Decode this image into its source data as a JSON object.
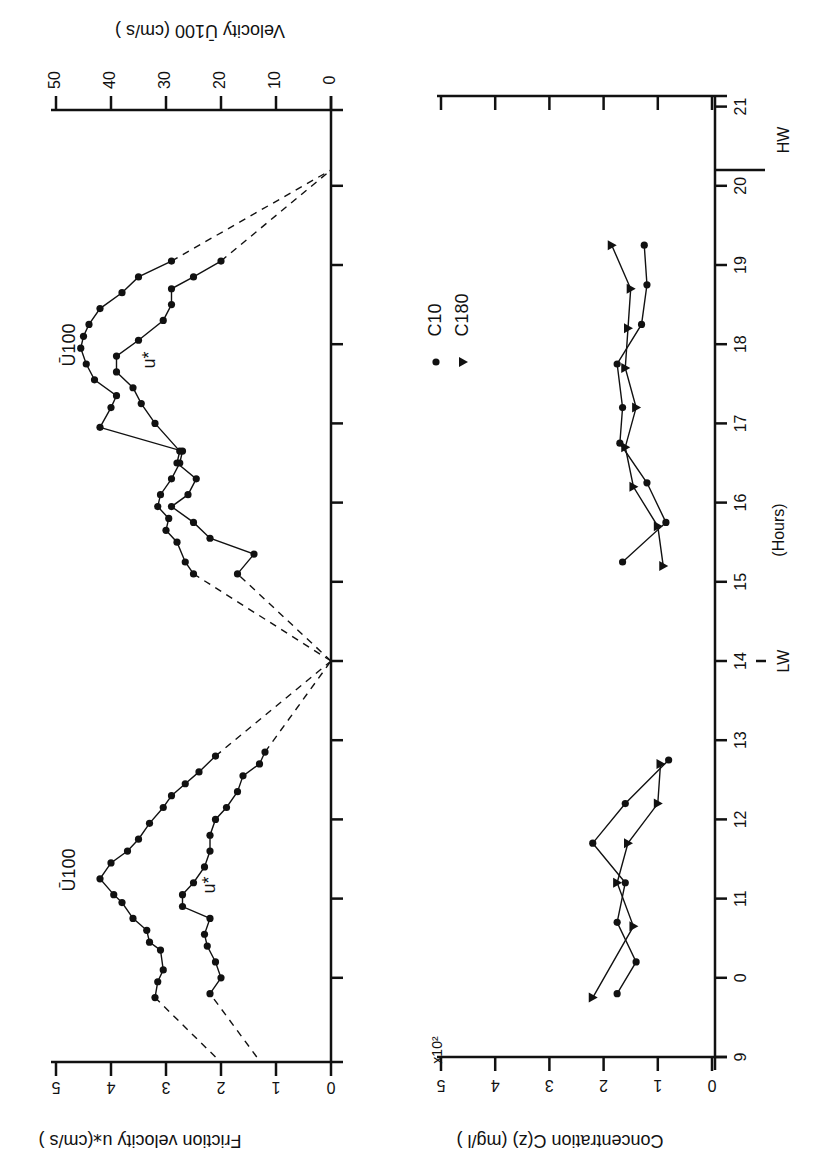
{
  "figure": {
    "orientation": "rotated 90deg clockwise",
    "x_axis": {
      "label": "(Hours)",
      "ticks": [
        9,
        10,
        11,
        12,
        13,
        14,
        15,
        16,
        17,
        18,
        19,
        20,
        21
      ],
      "tick_labels": [
        "9",
        "0",
        "11",
        "12",
        "13",
        "14",
        "15",
        "16",
        "17",
        "18",
        "19",
        "20",
        "21"
      ],
      "markers": [
        {
          "label": "LW",
          "hour": 14
        },
        {
          "label": "HW",
          "hour": 20.2
        }
      ]
    },
    "upper_panel": {
      "left_axis_label": "Friction velocity u⁎(cm/s )",
      "left_axis_ticks": [
        "0",
        "1",
        "2",
        "3",
        "4",
        "5"
      ],
      "right_axis_label": "Velocity Ū100 (cm/s )",
      "right_axis_ticks": [
        "0",
        "10",
        "20",
        "30",
        "40",
        "50"
      ],
      "series_labels": {
        "u100": "Ū100",
        "ustar": "u*"
      }
    },
    "lower_panel": {
      "axis_label": "Concentration C(z) (mg/l )",
      "axis_ticks": [
        "0",
        "1",
        "2",
        "3",
        "4",
        "5"
      ],
      "multiplier": "x10²",
      "legend": [
        {
          "marker": "circle",
          "label": "C10"
        },
        {
          "marker": "triangle",
          "label": "C180"
        }
      ]
    }
  },
  "chart_data": [
    {
      "type": "line",
      "title": "",
      "xlabel": "Hours",
      "ylabel": "Velocity Ū100 (cm/s) / Friction velocity u* (cm/s)",
      "xlim": [
        9,
        21
      ],
      "ylim_left": [
        0,
        5
      ],
      "ylim_right": [
        0,
        50
      ],
      "grid": false,
      "series": [
        {
          "name": "Ū100 (cm/s)",
          "x": [
            9.75,
            9.95,
            10.1,
            10.35,
            10.45,
            10.6,
            10.75,
            10.95,
            11.05,
            11.25,
            11.45,
            11.6,
            11.75,
            11.95,
            12.15,
            12.3,
            12.45,
            12.6,
            12.8,
            15.1,
            15.25,
            15.5,
            15.65,
            15.8,
            15.95,
            16.1,
            16.3,
            16.5,
            16.65,
            16.95,
            17.2,
            17.35,
            17.55,
            17.75,
            17.95,
            18.1,
            18.25,
            18.45,
            18.65,
            18.85,
            19.05
          ],
          "values": [
            32,
            31.5,
            30.5,
            31,
            33,
            33.5,
            36,
            38,
            39.5,
            42,
            40,
            37,
            35,
            33,
            30.5,
            29,
            26.5,
            24,
            21,
            25,
            26.5,
            28,
            30,
            29.5,
            31.5,
            31,
            29,
            27.5,
            27,
            42,
            40,
            39,
            43,
            44.5,
            45.5,
            45,
            44,
            42,
            38,
            35,
            29
          ]
        },
        {
          "name": "u* (cm/s)",
          "x": [
            9.8,
            10.0,
            10.2,
            10.4,
            10.55,
            10.75,
            10.9,
            11.05,
            11.2,
            11.4,
            11.6,
            11.8,
            12.0,
            12.15,
            12.35,
            12.55,
            12.7,
            12.85,
            15.1,
            15.35,
            15.55,
            15.75,
            15.95,
            16.1,
            16.3,
            16.5,
            16.65,
            17.0,
            17.25,
            17.45,
            17.65,
            17.85,
            18.05,
            18.3,
            18.5,
            18.7,
            18.85,
            19.05
          ],
          "values": [
            2.2,
            2.0,
            2.1,
            2.25,
            2.3,
            2.2,
            2.7,
            2.7,
            2.5,
            2.3,
            2.2,
            2.2,
            2.1,
            1.9,
            1.7,
            1.6,
            1.3,
            1.2,
            1.7,
            1.4,
            2.2,
            2.5,
            2.9,
            2.6,
            2.45,
            2.8,
            2.75,
            3.2,
            3.45,
            3.6,
            3.9,
            3.9,
            3.5,
            3.05,
            2.9,
            2.9,
            2.5,
            2.0
          ]
        },
        {
          "name": "Ū100 interpolation (dashed)",
          "x": [
            9.0,
            9.75,
            12.8,
            14.0,
            15.1,
            19.05,
            20.2
          ],
          "values": [
            21,
            32,
            21,
            0,
            25,
            29,
            0
          ]
        },
        {
          "name": "u* interpolation (dashed)",
          "x": [
            9.0,
            9.8,
            12.85,
            14.0,
            15.1,
            19.05,
            20.2
          ],
          "values": [
            1.35,
            2.2,
            1.2,
            0,
            1.7,
            2.0,
            0
          ]
        }
      ]
    },
    {
      "type": "line",
      "title": "",
      "xlabel": "Hours",
      "ylabel": "Concentration C(z) (mg/l) x10^2",
      "xlim": [
        9,
        21
      ],
      "ylim": [
        0,
        5
      ],
      "grid": false,
      "legend_position": "inside, near hour 18",
      "series": [
        {
          "name": "C10",
          "marker": "circle",
          "x": [
            9.8,
            10.2,
            10.7,
            11.2,
            11.7,
            12.2,
            12.75,
            15.25,
            15.75,
            16.25,
            16.75,
            17.2,
            17.75,
            18.25,
            18.75,
            19.25
          ],
          "values": [
            1.75,
            1.4,
            1.75,
            1.6,
            2.2,
            1.6,
            0.8,
            1.65,
            0.85,
            1.2,
            1.7,
            1.65,
            1.75,
            1.3,
            1.2,
            1.25
          ]
        },
        {
          "name": "C180",
          "marker": "triangle",
          "x": [
            9.75,
            10.65,
            11.2,
            11.7,
            12.2,
            12.7,
            15.2,
            15.7,
            16.2,
            16.7,
            17.2,
            17.7,
            18.2,
            18.7,
            19.25
          ],
          "values": [
            2.2,
            1.45,
            1.75,
            1.55,
            1.0,
            0.95,
            0.9,
            1.0,
            1.45,
            1.6,
            1.4,
            1.6,
            1.55,
            1.5,
            1.85
          ]
        }
      ]
    }
  ]
}
